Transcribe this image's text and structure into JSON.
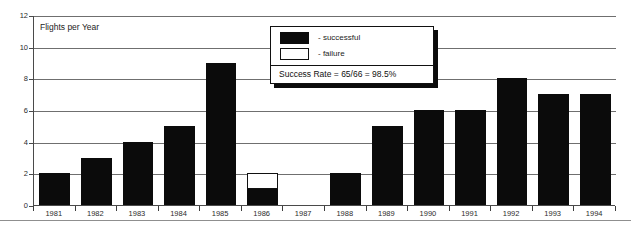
{
  "chart_data": {
    "type": "bar",
    "title": "Flights per Year",
    "xlabel": "",
    "ylabel": "",
    "ylim": [
      0,
      12
    ],
    "yticks": [
      0,
      2,
      4,
      6,
      8,
      10,
      12
    ],
    "grid": true,
    "stacked": true,
    "categories": [
      "1981",
      "1982",
      "1983",
      "1984",
      "1985",
      "1986",
      "1987",
      "1988",
      "1989",
      "1990",
      "1991",
      "1992",
      "1993",
      "1994"
    ],
    "series": [
      {
        "name": "successful",
        "color": "#0b0b0b",
        "values": [
          2,
          3,
          4,
          5,
          9,
          1,
          0,
          2,
          5,
          6,
          6,
          8,
          7,
          7
        ]
      },
      {
        "name": "failure",
        "color": "#ffffff",
        "values": [
          0,
          0,
          0,
          0,
          0,
          1,
          0,
          0,
          0,
          0,
          0,
          0,
          0,
          0
        ]
      }
    ],
    "totals": [
      2,
      3,
      4,
      5,
      9,
      2,
      0,
      2,
      5,
      6,
      6,
      8,
      7,
      7
    ],
    "legend_position": "top-center-right",
    "annotations": [
      "Success Rate = 65/66 = 98.5%"
    ]
  },
  "legend": {
    "entries": [
      {
        "label": "- successful",
        "swatch": "filled"
      },
      {
        "label": "- failure",
        "swatch": "hollow"
      }
    ],
    "success_rate_text": "Success Rate = 65/66 = 98.5%"
  },
  "axis": {
    "y_tick_labels": [
      "12",
      "10",
      "8",
      "6",
      "4",
      "2",
      "0"
    ],
    "x_tick_labels": [
      "1981",
      "1982",
      "1983",
      "1984",
      "1985",
      "1986",
      "1987",
      "1988",
      "1989",
      "1990",
      "1991",
      "1992",
      "1993",
      "1994"
    ]
  },
  "colors": {
    "successful": "#0b0b0b",
    "failure": "#ffffff",
    "grid": "#6f6f6f",
    "axis": "#4a4a4a",
    "text": "#1c1c1c",
    "background": "#ffffff"
  }
}
